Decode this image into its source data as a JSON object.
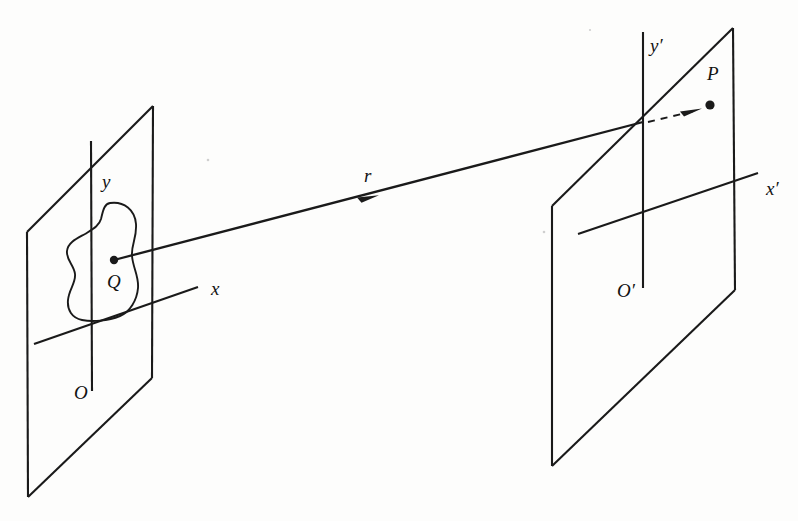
{
  "figure": {
    "background_color": "#fdfdfc",
    "ink_color": "#1a1a1a"
  },
  "labels": {
    "y_axis_left": "y",
    "x_axis_left": "x",
    "origin_left": "O",
    "source_point": "Q",
    "vector_r": "r",
    "y_axis_right": "y′",
    "x_axis_right": "x′",
    "origin_right": "O′",
    "field_point": "P"
  },
  "geometry": {
    "left_plane": {
      "name": "source-plane",
      "corners": [
        [
          153,
          106
        ],
        [
          152,
          378
        ],
        [
          28,
          497
        ],
        [
          27,
          232
        ]
      ]
    },
    "right_plane": {
      "name": "field-plane",
      "corners": [
        [
          733,
          28
        ],
        [
          735,
          290
        ],
        [
          552,
          466
        ],
        [
          552,
          206
        ]
      ]
    },
    "left_y_axis": {
      "x1": 91,
      "y1": 141,
      "x2": 92,
      "y2": 391
    },
    "left_x_axis": {
      "x1": 34,
      "y1": 344,
      "x2": 198,
      "y2": 287
    },
    "right_y_axis": {
      "x1": 643,
      "y1": 32,
      "x2": 643,
      "y2": 288
    },
    "right_x_axis": {
      "x1": 578,
      "y1": 234,
      "x2": 758,
      "y2": 173
    },
    "ray": {
      "x1": 114,
      "y1": 260,
      "x2": 643,
      "y2": 122
    },
    "ray_arrow_at": [
      372,
      197
    ],
    "dashed_segment": {
      "x1": 648,
      "y1": 122,
      "x2": 700,
      "y2": 110
    },
    "dashed_arrow_at": [
      700,
      110
    ],
    "source_dot": [
      114,
      260
    ],
    "field_dot": [
      710,
      105
    ],
    "blob_centroid": [
      103,
      262
    ]
  },
  "label_positions": {
    "y": [
      102,
      188
    ],
    "x": [
      211,
      295
    ],
    "O": [
      74,
      399
    ],
    "Q": [
      107,
      288
    ],
    "r": [
      364,
      182
    ],
    "y_prime": [
      650,
      52
    ],
    "x_prime": [
      766,
      195
    ],
    "O_prime": [
      617,
      297
    ],
    "P": [
      707,
      80
    ]
  }
}
